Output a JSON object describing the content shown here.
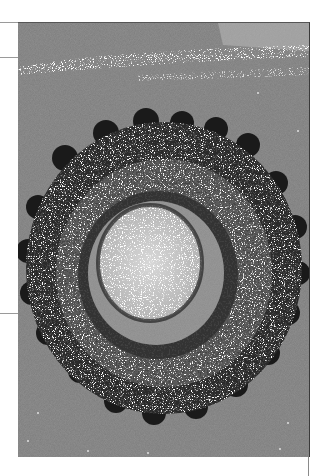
{
  "page": {
    "background": "#ffffff"
  },
  "figure": {
    "type": "electron-micrograph",
    "tone": "grayscale",
    "background_color": "#7b7b7b",
    "highlight_patch_color": "#9d9d9d",
    "outer_spike_color": "#111111",
    "speckle_color": "#e8e8e8"
  },
  "rules": {
    "left_top_y": 22,
    "left_mid_y": 57,
    "left_low_y": 313,
    "right_vertical_x": 308
  }
}
